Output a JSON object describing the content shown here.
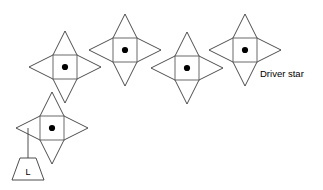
{
  "figure": {
    "background_color": "#ffffff",
    "line_color": "#3a3a3a",
    "square_line_color": "#5a5a5a",
    "dot_color": "#000000",
    "text_color": "#000000"
  },
  "labels": {
    "driver_star": "Driver star",
    "load": "L"
  },
  "stars": [
    {
      "id": "star-1",
      "cx": 65,
      "cy": 67,
      "half_square": 12,
      "point_length": 24,
      "dot_radius": 3.1
    },
    {
      "id": "star-2",
      "cx": 125,
      "cy": 50,
      "half_square": 12,
      "point_length": 24,
      "dot_radius": 3.1
    },
    {
      "id": "star-3",
      "cx": 187,
      "cy": 68,
      "half_square": 12,
      "point_length": 24,
      "dot_radius": 3.1
    },
    {
      "id": "star-4",
      "cx": 245,
      "cy": 50,
      "half_square": 12,
      "point_length": 24,
      "dot_radius": 3.1
    },
    {
      "id": "star-5",
      "cx": 52,
      "cy": 128,
      "half_square": 12,
      "point_length": 24,
      "dot_radius": 3.1
    }
  ],
  "driver_star_label": {
    "x": 260,
    "y": 77,
    "anchor_star": "star-4"
  },
  "load_marker": {
    "anchor_star": "star-5",
    "link_x": 28,
    "link_y_top": 128,
    "link_y_bottom": 158,
    "trapezoid": {
      "top_left_x": 20,
      "top_right_x": 36,
      "top_y": 158,
      "bottom_left_x": 12,
      "bottom_right_x": 44,
      "bottom_y": 180
    },
    "letter_x": 28,
    "letter_y": 175
  }
}
